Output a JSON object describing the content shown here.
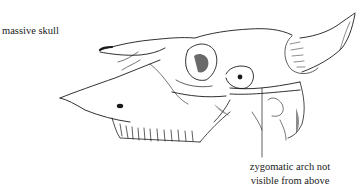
{
  "figure": {
    "labels": {
      "skull": "massive skull",
      "arch_line1": "zygomatic arch not",
      "arch_line2": "visible from above"
    },
    "colors": {
      "ink": "#1a1a1a",
      "background": "#ffffff"
    }
  }
}
